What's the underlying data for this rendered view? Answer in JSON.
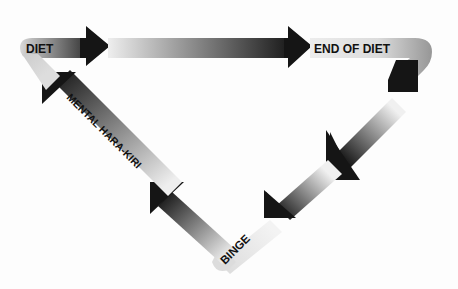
{
  "diagram": {
    "type": "cycle",
    "nodes": [
      {
        "id": "diet",
        "label": "DIET"
      },
      {
        "id": "end_of_diet",
        "label": "END OF DIET"
      },
      {
        "id": "binge",
        "label": "BINGE"
      },
      {
        "id": "mental_hara_kiri",
        "label": "MENTAL HARA-KIRI"
      }
    ],
    "edges": [
      {
        "from": "diet",
        "to": "end_of_diet"
      },
      {
        "from": "end_of_diet",
        "to": "binge"
      },
      {
        "from": "binge",
        "to": "mental_hara_kiri"
      },
      {
        "from": "mental_hara_kiri",
        "to": "diet"
      }
    ],
    "colors": {
      "arrow_dark": "#111111",
      "arrow_light": "#e6e6e6",
      "background": "#fdfdfd"
    }
  }
}
